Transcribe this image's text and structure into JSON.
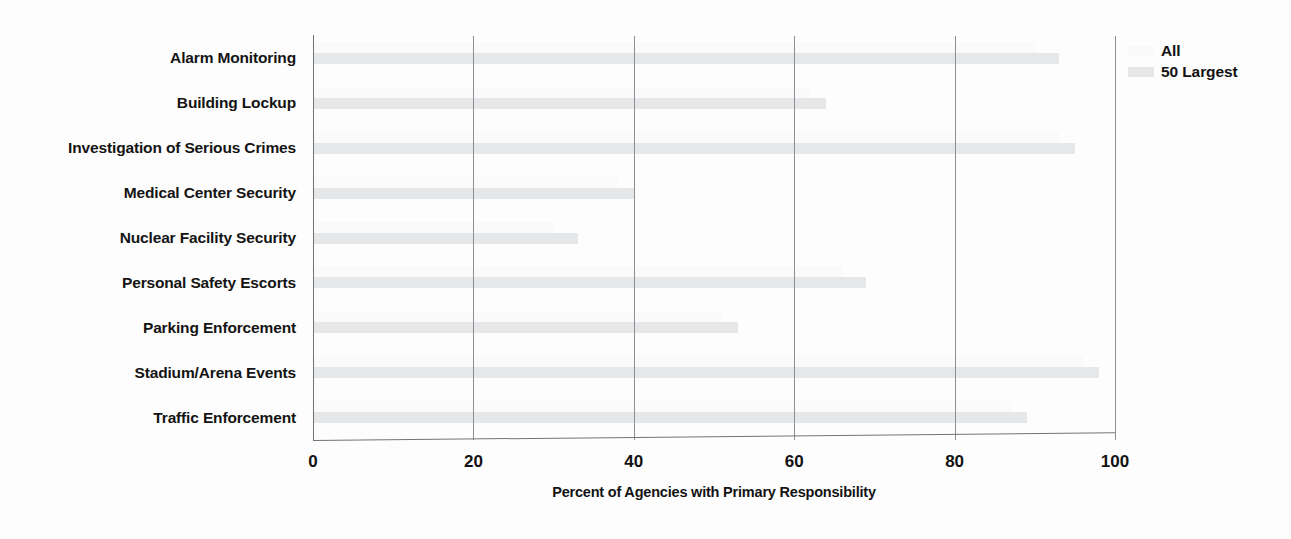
{
  "chart_data": {
    "type": "bar",
    "orientation": "horizontal",
    "title": "",
    "xlabel": "Percent of Agencies with Primary Responsibility",
    "ylabel": "",
    "xlim": [
      0,
      100
    ],
    "xticks": [
      0,
      20,
      40,
      60,
      80,
      100
    ],
    "grid": "vertical",
    "legend_position": "top-right",
    "categories": [
      "Alarm Monitoring",
      "Building Lockup",
      "Investigation of Serious Crimes",
      "Medical Center Security",
      "Nuclear Facility Security",
      "Personal Safety Escorts",
      "Parking Enforcement",
      "Stadium/Arena Events",
      "Traffic Enforcement"
    ],
    "series": [
      {
        "name": "All",
        "color": "#fafafa",
        "values": [
          90,
          62,
          93,
          38,
          30,
          66,
          51,
          96,
          87
        ]
      },
      {
        "name": "50 Largest",
        "color": "#e6e7e8",
        "values": [
          93,
          64,
          95,
          40,
          33,
          69,
          53,
          98,
          89
        ]
      }
    ]
  },
  "axis": {
    "x_title": "Percent of Agencies with Primary Responsibility",
    "tick_labels": [
      "0",
      "20",
      "40",
      "60",
      "80",
      "100"
    ]
  },
  "legend": {
    "items": [
      {
        "label": "All",
        "color": "#fafafa"
      },
      {
        "label": "50 Largest",
        "color": "#e6e7e8"
      }
    ]
  }
}
